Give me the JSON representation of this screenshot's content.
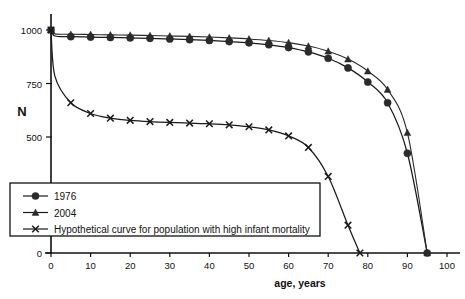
{
  "chart_data": {
    "type": "line",
    "title": "",
    "xlabel": "age, years",
    "ylabel": "N",
    "xlim": [
      0,
      100
    ],
    "ylim": [
      0,
      1000
    ],
    "grid": false,
    "legend_position": "lower-left-inside",
    "xticks": [
      0,
      10,
      20,
      30,
      40,
      50,
      60,
      70,
      80,
      90,
      100
    ],
    "xtick_labels": [
      "0",
      "10",
      "20",
      "30",
      "40",
      "50",
      "60",
      "70",
      "80",
      "90",
      "100"
    ],
    "yticks": [
      0,
      500,
      750,
      1000
    ],
    "ytick_labels": [
      "0",
      "500",
      "750",
      "1000"
    ],
    "series": [
      {
        "name": "1976",
        "marker": "circle",
        "x": [
          0,
          1,
          5,
          10,
          15,
          20,
          25,
          30,
          35,
          40,
          45,
          50,
          55,
          60,
          65,
          70,
          75,
          80,
          85,
          90,
          95
        ],
        "y": [
          1000,
          972,
          969,
          967,
          965,
          963,
          961,
          958,
          955,
          951,
          946,
          940,
          931,
          918,
          898,
          868,
          823,
          757,
          660,
          430,
          0
        ]
      },
      {
        "name": "2004",
        "marker": "triangle",
        "x": [
          0,
          1,
          5,
          10,
          15,
          20,
          25,
          30,
          35,
          40,
          45,
          50,
          55,
          60,
          65,
          70,
          75,
          80,
          85,
          90,
          95
        ],
        "y": [
          1000,
          982,
          980,
          979,
          977,
          976,
          974,
          972,
          970,
          967,
          963,
          958,
          951,
          941,
          925,
          901,
          864,
          808,
          722,
          520,
          0
        ]
      },
      {
        "name": "Hypothetical curve for population with high infant mortality",
        "marker": "x",
        "x": [
          0,
          1,
          5,
          10,
          15,
          20,
          25,
          30,
          35,
          40,
          45,
          50,
          55,
          60,
          65,
          70,
          75,
          78
        ],
        "y": [
          1000,
          783,
          660,
          610,
          588,
          578,
          572,
          568,
          565,
          562,
          557,
          548,
          533,
          505,
          455,
          330,
          120,
          0
        ]
      }
    ]
  },
  "legend": {
    "entries": [
      {
        "label": "1976",
        "marker": "circle"
      },
      {
        "label": "2004",
        "marker": "triangle"
      },
      {
        "label": "Hypothetical curve for population with high infant mortality",
        "marker": "x"
      }
    ]
  },
  "colors": {
    "ink": "#111111",
    "series": "#2b2b2b",
    "background": "#ffffff"
  }
}
